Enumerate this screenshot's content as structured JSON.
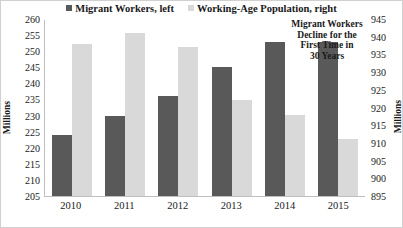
{
  "chart_data": {
    "type": "bar",
    "title": "",
    "subtitle": "",
    "categories": [
      "2010",
      "2011",
      "2012",
      "2013",
      "2014",
      "2015"
    ],
    "series": [
      {
        "name": "Migrant Workers, left",
        "axis": "left",
        "color": "#595959",
        "values": [
          224,
          230,
          236,
          245,
          253,
          253
        ]
      },
      {
        "name": "Working-Age Population, right",
        "axis": "right",
        "color": "#d9d9d9",
        "values": [
          938,
          941,
          937,
          922,
          918,
          911
        ]
      }
    ],
    "xlabel": "",
    "ylabel": "Millions",
    "y2label": "Millions",
    "ylim": [
      205,
      260
    ],
    "y2lim": [
      895,
      945
    ],
    "ytick_step": 5,
    "y2tick_step": 5,
    "yticks": [
      205,
      210,
      215,
      220,
      225,
      230,
      235,
      240,
      245,
      250,
      255,
      260
    ],
    "y2ticks": [
      895,
      900,
      905,
      910,
      915,
      920,
      925,
      930,
      935,
      940,
      945
    ],
    "grid": false,
    "legend_position": "top",
    "annotations": [
      {
        "text": "Migrant Workers Decline for the First Time in 30 Years",
        "lines": [
          "Migrant Workers",
          "Decline for the",
          "First Time in",
          "30 Years"
        ],
        "anchor_category": "2015"
      }
    ]
  },
  "legend": {
    "items": [
      {
        "label": "Migrant Workers, left",
        "color": "#595959"
      },
      {
        "label": "Working-Age Population, right",
        "color": "#d9d9d9"
      }
    ]
  },
  "axes": {
    "left": {
      "title": "Millions",
      "ticks": [
        "260",
        "255",
        "250",
        "245",
        "240",
        "235",
        "230",
        "225",
        "220",
        "215",
        "210",
        "205"
      ]
    },
    "right": {
      "title": "Millions",
      "ticks": [
        "945",
        "940",
        "935",
        "930",
        "925",
        "920",
        "915",
        "910",
        "905",
        "900",
        "895"
      ]
    },
    "category": {
      "labels": [
        "2010",
        "2011",
        "2012",
        "2013",
        "2014",
        "2015"
      ]
    }
  },
  "annotation": {
    "line1": "Migrant Workers",
    "line2": "Decline for the",
    "line3": "First Time in",
    "line4": "30 Years"
  }
}
